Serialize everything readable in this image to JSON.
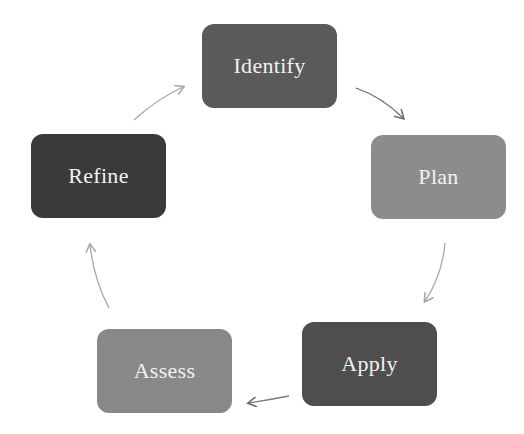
{
  "diagram": {
    "type": "cycle",
    "nodes": [
      {
        "id": "identify",
        "label": "Identify",
        "color": "#5a5a5a",
        "x": 202,
        "y": 24,
        "w": 135,
        "h": 84
      },
      {
        "id": "plan",
        "label": "Plan",
        "color": "#8c8c8c",
        "x": 371,
        "y": 135,
        "w": 135,
        "h": 84
      },
      {
        "id": "apply",
        "label": "Apply",
        "color": "#4e4e4e",
        "x": 302,
        "y": 322,
        "w": 135,
        "h": 84
      },
      {
        "id": "assess",
        "label": "Assess",
        "color": "#888888",
        "x": 97,
        "y": 329,
        "w": 135,
        "h": 84
      },
      {
        "id": "refine",
        "label": "Refine",
        "color": "#3a3a3a",
        "x": 31,
        "y": 134,
        "w": 135,
        "h": 84
      }
    ],
    "edges": [
      {
        "from": "identify",
        "to": "plan"
      },
      {
        "from": "plan",
        "to": "apply"
      },
      {
        "from": "apply",
        "to": "assess"
      },
      {
        "from": "assess",
        "to": "refine"
      },
      {
        "from": "refine",
        "to": "identify"
      }
    ]
  }
}
